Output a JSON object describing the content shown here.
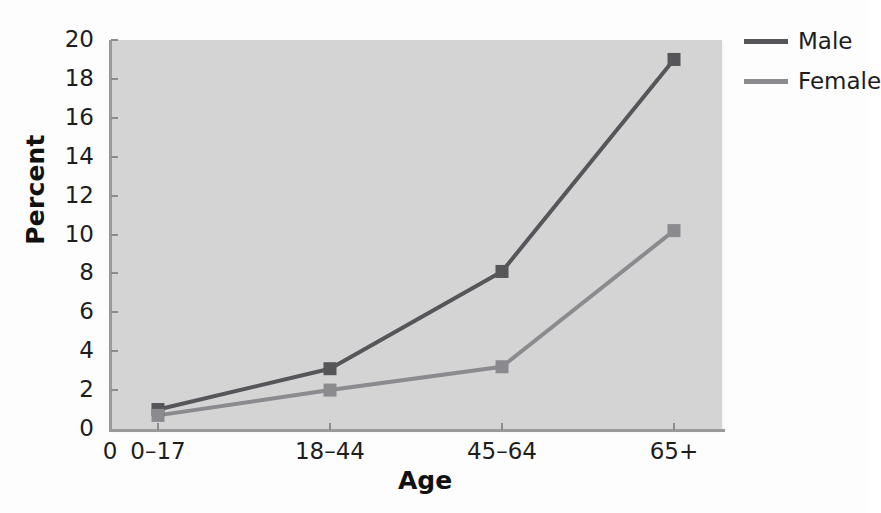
{
  "chart_data": {
    "type": "line",
    "title": "",
    "xlabel": "Age",
    "ylabel": "Percent",
    "categories": [
      "0–17",
      "18–44",
      "45–64",
      "65+"
    ],
    "origin_label": "0",
    "series": [
      {
        "name": "Male",
        "values": [
          1.0,
          3.1,
          8.1,
          19.0
        ],
        "color": "#55555a"
      },
      {
        "name": "Female",
        "values": [
          0.7,
          2.0,
          3.2,
          10.2
        ],
        "color": "#8a8a8f"
      }
    ],
    "ylim": [
      0,
      20
    ],
    "ytick_step": 2,
    "yticks": [
      "0",
      "2",
      "4",
      "6",
      "8",
      "10",
      "12",
      "14",
      "16",
      "18",
      "20"
    ],
    "grid": false,
    "legend_position": "top-right",
    "marker": "square",
    "plot_background": "#d4d4d4",
    "figure_background": "#fdfdfd",
    "axis_color": "#9a9a9a",
    "text_color": "#1d1d1d"
  },
  "legend": {
    "entries": [
      {
        "label": "Male"
      },
      {
        "label": "Female"
      }
    ]
  }
}
